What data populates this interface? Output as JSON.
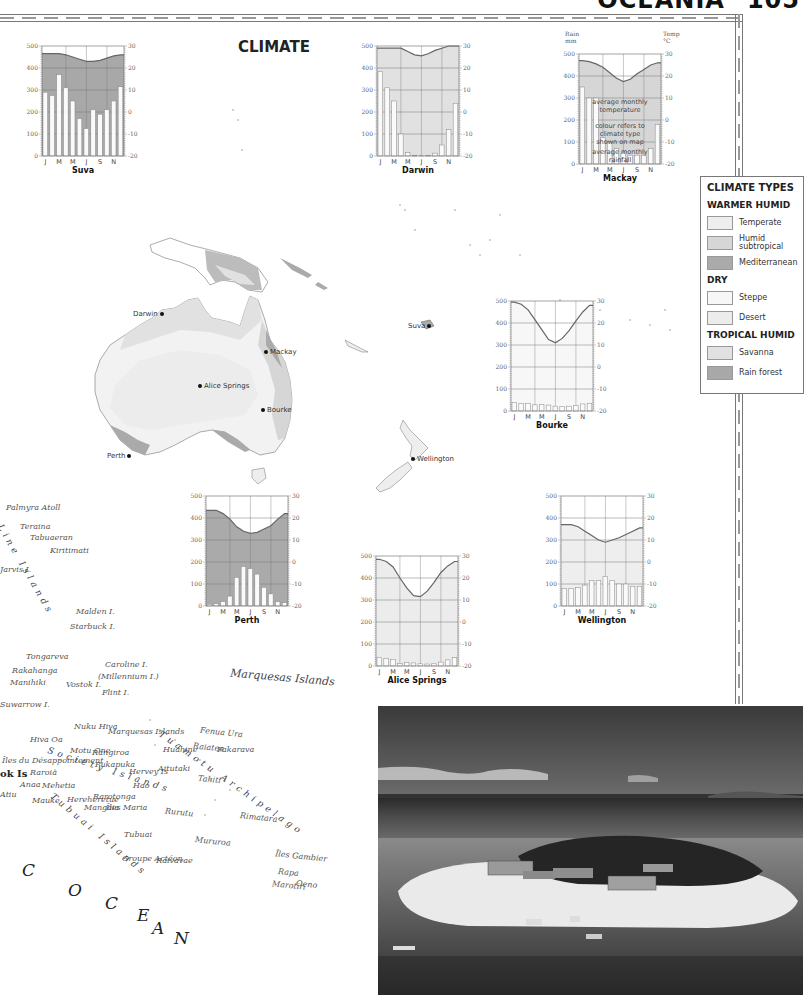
{
  "page": {
    "section": "OCEANIA",
    "page_number": "105",
    "map_title": "CLIMATE"
  },
  "legend": {
    "title": "CLIMATE TYPES",
    "groups": [
      {
        "label": "WARMER HUMID",
        "items": [
          {
            "label": "Temperate",
            "color": "#eeeeee"
          },
          {
            "label": "Humid subtropical",
            "color": "#d6d6d6"
          },
          {
            "label": "Mediterranean",
            "color": "#aaaaaa"
          }
        ]
      },
      {
        "label": "DRY",
        "items": [
          {
            "label": "Steppe",
            "color": "#f7f7f7"
          },
          {
            "label": "Desert",
            "color": "#ececec"
          }
        ]
      },
      {
        "label": "TROPICAL HUMID",
        "items": [
          {
            "label": "Savanna",
            "color": "#e1e1e1"
          },
          {
            "label": "Rain forest",
            "color": "#a8a8a8"
          }
        ]
      }
    ]
  },
  "map_cities": [
    {
      "name": "Darwin"
    },
    {
      "name": "Mackay"
    },
    {
      "name": "Alice Springs"
    },
    {
      "name": "Bourke"
    },
    {
      "name": "Perth"
    },
    {
      "name": "Suva"
    },
    {
      "name": "Wellington"
    }
  ],
  "map_labels": {
    "islands": [
      "Palmyra Atoll",
      "Teraina",
      "Tabuaeran",
      "Kiritimati",
      "Jarvis I.",
      "Malden I.",
      "Starbuck I.",
      "Tongareva",
      "Rakahanga",
      "Manihiki",
      "Caroline I.",
      "(Millennium I.)",
      "Vostok I.",
      "Flint I.",
      "Suwarrow I.",
      "Nuku Hiva",
      "Marquesas Islands",
      "Hiva Oa",
      "Motu One",
      "Rangiroa",
      "Fenua Ura",
      "Raiatea",
      "Huahine",
      "Fakarava",
      "Îles du Désappointement",
      "Raroia",
      "Pukapuka",
      "Aitutaki",
      "Hervey Is",
      "Tahiti",
      "Anaa",
      "Mehetia",
      "Hao",
      "Atiu",
      "Mauke",
      "Hereheretue",
      "Rarotonga",
      "Mangaia",
      "Îles Maria",
      "Rurutu",
      "Rimatara",
      "Tubuai",
      "Mururoa",
      "Groupe Actéon",
      "Raivavae",
      "Îles Gambier",
      "Rapa",
      "Marotiri",
      "Oeno",
      "Henderson I.",
      "Pitcairn I.",
      "Ducie I."
    ],
    "archipelagos": [
      "Line Islands",
      "Society Islands",
      "Tuamotu Archipelago",
      "Tubuai Islands",
      "Cook Is"
    ],
    "ocean_letters": [
      "C",
      "O",
      "C",
      "E",
      "A",
      "N"
    ]
  },
  "chart_labels": {
    "months": [
      "J",
      "M",
      "M",
      "J",
      "S",
      "N"
    ],
    "rain_axis_title": "Rain mm",
    "temp_axis_title": "Temp °C",
    "rain_ticks": [
      "0",
      "100",
      "200",
      "300",
      "400",
      "500"
    ],
    "temp_ticks": [
      "-20",
      "-10",
      "0",
      "10",
      "20",
      "30"
    ],
    "annot_temp": "average monthly temperature",
    "annot_colour": "colour refers to climate type shown on map",
    "annot_rain": "average monthly rainfall"
  },
  "chart_data": [
    {
      "type": "bar+line",
      "title": "Suva",
      "climate": "Rain forest",
      "fill": "#a8a8a8",
      "x": [
        "J",
        "F",
        "M",
        "A",
        "M",
        "J",
        "J",
        "A",
        "S",
        "O",
        "N",
        "D"
      ],
      "series": [
        {
          "name": "Rainfall (mm)",
          "values": [
            290,
            275,
            370,
            310,
            250,
            170,
            125,
            210,
            190,
            210,
            250,
            315
          ]
        },
        {
          "name": "Temperature (°C)",
          "values": [
            26.5,
            26.5,
            26.5,
            26,
            25,
            24,
            23,
            23,
            23.5,
            24.5,
            25.5,
            26
          ]
        }
      ],
      "ylim_left": [
        0,
        500
      ],
      "ylim_right": [
        -20,
        30
      ]
    },
    {
      "type": "bar+line",
      "title": "Darwin",
      "climate": "Savanna",
      "fill": "#e1e1e1",
      "x": [
        "J",
        "F",
        "M",
        "A",
        "M",
        "J",
        "J",
        "A",
        "S",
        "O",
        "N",
        "D"
      ],
      "series": [
        {
          "name": "Rainfall (mm)",
          "values": [
            385,
            310,
            250,
            100,
            15,
            2,
            1,
            3,
            13,
            50,
            120,
            240
          ]
        },
        {
          "name": "Temperature (°C)",
          "values": [
            29,
            29,
            29,
            29,
            27.5,
            26,
            25.5,
            26.5,
            28,
            29,
            30,
            30
          ]
        }
      ],
      "ylim_left": [
        0,
        500
      ],
      "ylim_right": [
        -20,
        30
      ]
    },
    {
      "type": "bar+line",
      "title": "Mackay",
      "climate": "Humid subtropical",
      "fill": "#d6d6d6",
      "x": [
        "J",
        "F",
        "M",
        "A",
        "M",
        "J",
        "J",
        "A",
        "S",
        "O",
        "N",
        "D"
      ],
      "series": [
        {
          "name": "Rainfall (mm)",
          "values": [
            350,
            300,
            300,
            120,
            100,
            70,
            50,
            40,
            40,
            40,
            70,
            180
          ]
        },
        {
          "name": "Temperature (°C)",
          "values": [
            27,
            26.5,
            25.5,
            24,
            21.5,
            19,
            17.5,
            18.5,
            21,
            23,
            25,
            26
          ]
        }
      ],
      "ylim_left": [
        0,
        500
      ],
      "ylim_right": [
        -20,
        30
      ]
    },
    {
      "type": "bar+line",
      "title": "Bourke",
      "climate": "Steppe",
      "fill": "#f7f7f7",
      "x": [
        "J",
        "F",
        "M",
        "A",
        "M",
        "J",
        "J",
        "A",
        "S",
        "O",
        "N",
        "D"
      ],
      "series": [
        {
          "name": "Rainfall (mm)",
          "values": [
            38,
            35,
            33,
            28,
            30,
            27,
            22,
            20,
            22,
            25,
            32,
            35
          ]
        },
        {
          "name": "Temperature (°C)",
          "values": [
            29.5,
            28.5,
            26,
            21.5,
            17,
            12.5,
            11,
            13,
            16.5,
            21,
            25,
            28
          ]
        }
      ],
      "ylim_left": [
        0,
        500
      ],
      "ylim_right": [
        -20,
        30
      ]
    },
    {
      "type": "bar+line",
      "title": "Perth",
      "climate": "Mediterranean",
      "fill": "#aaaaaa",
      "x": [
        "J",
        "F",
        "M",
        "A",
        "M",
        "J",
        "J",
        "A",
        "S",
        "O",
        "N",
        "D"
      ],
      "series": [
        {
          "name": "Rainfall (mm)",
          "values": [
            8,
            10,
            20,
            45,
            130,
            180,
            170,
            145,
            85,
            55,
            20,
            15
          ]
        },
        {
          "name": "Temperature (°C)",
          "values": [
            23.5,
            23.5,
            22,
            19.5,
            16,
            14,
            13,
            13.5,
            15,
            16.5,
            19.5,
            22
          ]
        }
      ],
      "ylim_left": [
        0,
        500
      ],
      "ylim_right": [
        -20,
        30
      ]
    },
    {
      "type": "bar+line",
      "title": "Alice Springs",
      "climate": "Desert",
      "fill": "#ececec",
      "x": [
        "J",
        "F",
        "M",
        "A",
        "M",
        "J",
        "J",
        "A",
        "S",
        "O",
        "N",
        "D"
      ],
      "series": [
        {
          "name": "Rainfall (mm)",
          "values": [
            40,
            35,
            30,
            12,
            15,
            14,
            10,
            9,
            10,
            18,
            28,
            38
          ]
        },
        {
          "name": "Temperature (°C)",
          "values": [
            28.5,
            27.5,
            25,
            20,
            15.5,
            12,
            11.5,
            14,
            18,
            22.5,
            25.5,
            27.5
          ]
        }
      ],
      "ylim_left": [
        0,
        500
      ],
      "ylim_right": [
        -20,
        30
      ]
    },
    {
      "type": "bar+line",
      "title": "Wellington",
      "climate": "Temperate",
      "fill": "#eeeeee",
      "x": [
        "J",
        "F",
        "M",
        "A",
        "M",
        "J",
        "J",
        "A",
        "S",
        "O",
        "N",
        "D"
      ],
      "series": [
        {
          "name": "Rainfall (mm)",
          "values": [
            80,
            80,
            85,
            95,
            115,
            115,
            135,
            115,
            100,
            100,
            90,
            90
          ]
        },
        {
          "name": "Temperature (°C)",
          "values": [
            17,
            17,
            16,
            14,
            12,
            10,
            9,
            10,
            11,
            12.5,
            14,
            15.5
          ]
        }
      ],
      "ylim_left": [
        0,
        500
      ],
      "ylim_right": [
        -20,
        30
      ]
    }
  ],
  "photo": {
    "subject": "aerial view of small coral island with resort buildings and palm trees"
  }
}
